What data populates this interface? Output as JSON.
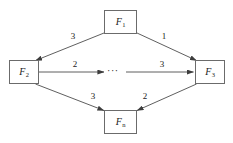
{
  "figure": {
    "type": "directed-weighted-graph",
    "background_color": "#ffffff",
    "node_stroke_color": "#6b6b6b",
    "edge_stroke_color": "#4d4d4d",
    "text_color": "#1a1a1a"
  },
  "nodes": [
    {
      "id": "F1",
      "base": "F",
      "sub": "1",
      "position": "top"
    },
    {
      "id": "F2",
      "base": "F",
      "sub": "2",
      "position": "left"
    },
    {
      "id": "F3",
      "base": "F",
      "sub": "3",
      "position": "right"
    },
    {
      "id": "Fn",
      "base": "F",
      "sub": "n",
      "position": "bottom"
    }
  ],
  "edges": [
    {
      "from": "F1",
      "to": "F2",
      "weight": "3",
      "label_position": "upper-left"
    },
    {
      "from": "F1",
      "to": "F3",
      "weight": "1",
      "label_position": "upper-right"
    },
    {
      "from": "F2",
      "to": "F3",
      "weight": "2",
      "label_position": "middle-left"
    },
    {
      "from": "F2",
      "to": "F3",
      "weight": "3",
      "label_position": "middle-right"
    },
    {
      "from": "F2",
      "to": "Fn",
      "weight": "3",
      "label_position": "lower-left"
    },
    {
      "from": "Fn",
      "to": "F3",
      "weight": "2",
      "label_position": "lower-right"
    }
  ],
  "middle_ellipsis": "···"
}
